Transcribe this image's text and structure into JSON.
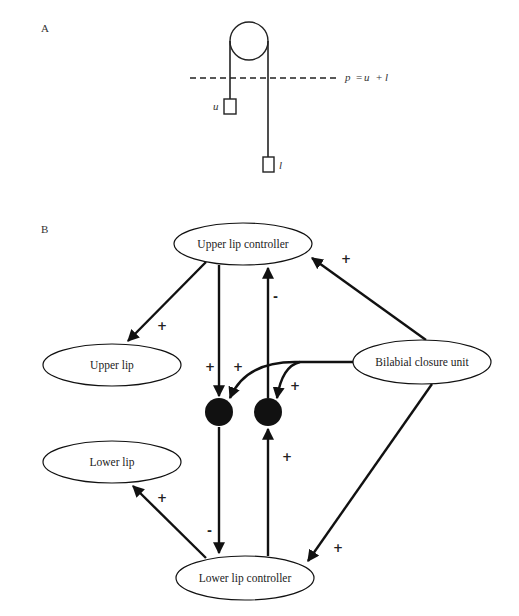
{
  "figure": {
    "panel_a": {
      "label": "A",
      "equation": {
        "p": "p",
        "eq": "=",
        "u": "u",
        "plus": "+",
        "l": "l"
      },
      "weights": {
        "upper": "u",
        "lower": "l"
      }
    },
    "panel_b": {
      "label": "B",
      "nodes": {
        "upper_lip_controller": "Upper lip controller",
        "upper_lip": "Upper lip",
        "bilabial_closure_unit": "Bilabial closure unit",
        "lower_lip": "Lower lip",
        "lower_lip_controller": "Lower lip controller"
      },
      "edges": [
        {
          "from": "Upper lip controller",
          "to": "Upper lip",
          "sign": "+"
        },
        {
          "from": "Upper lip controller",
          "to": "left junction",
          "sign": "+"
        },
        {
          "from": "right junction",
          "to": "Upper lip controller",
          "sign": "-"
        },
        {
          "from": "Bilabial closure unit",
          "to": "Upper lip controller",
          "sign": "+"
        },
        {
          "from": "Bilabial closure unit",
          "to": "left junction",
          "sign": "+"
        },
        {
          "from": "Bilabial closure unit",
          "to": "right junction",
          "sign": "+"
        },
        {
          "from": "left junction",
          "to": "Lower lip controller",
          "sign": "-"
        },
        {
          "from": "Lower lip controller",
          "to": "right junction",
          "sign": "+"
        },
        {
          "from": "Lower lip controller",
          "to": "Lower lip",
          "sign": "+"
        },
        {
          "from": "Bilabial closure unit",
          "to": "Lower lip controller",
          "sign": "+"
        }
      ]
    }
  }
}
